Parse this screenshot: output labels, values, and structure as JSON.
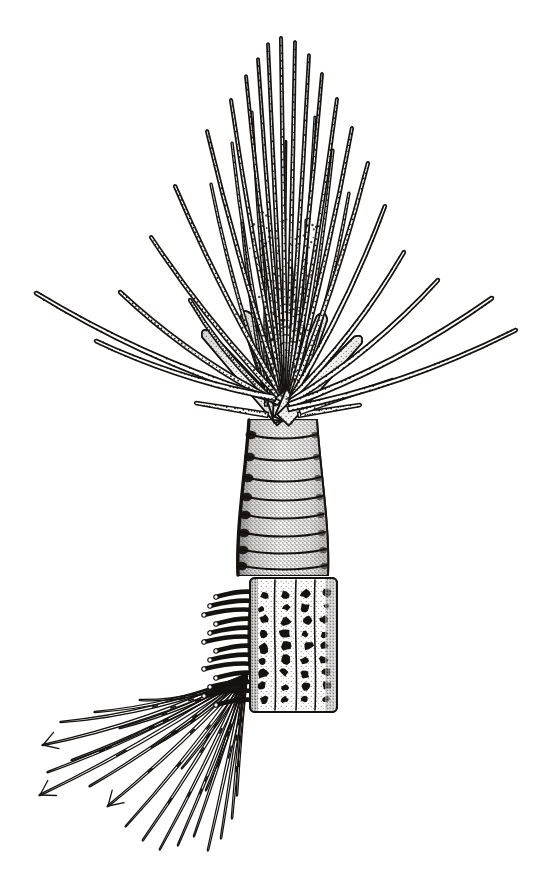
{
  "figure": {
    "domain": "Natural-Image",
    "kind": "scientific-line-drawing",
    "technique": "pen-and-ink stipple",
    "caption": "",
    "background_color": "#ffffff",
    "ink_color": "#15120f",
    "canvas": {
      "width": 549,
      "height": 875
    }
  },
  "anatomy": {
    "parts": [
      {
        "id": "tentacle-crown",
        "label": "Buccal tentacle crown",
        "note": "dense spray of long slender grooved tentacles radiating upward and outward"
      },
      {
        "id": "crown-base-lobes",
        "label": "Crown basal lobes",
        "note": "broad overlapping stippled lobes at the tentacle origin"
      },
      {
        "id": "thorax-segments",
        "label": "Ringed thoracic segments",
        "note": "cylindrical stalk with ~8 annular rings, heavy stipple shading"
      },
      {
        "id": "abdominal-plate",
        "label": "Papillated abdominal plate",
        "note": "rectangular plate bearing columns of dark rounded papillae"
      },
      {
        "id": "uncinal-comb",
        "label": "Uncinal comb / neuropodial hooks",
        "note": "comb-like row of short thick hooks on the left margin of the plate"
      },
      {
        "id": "capillary-chaetae",
        "label": "Capillary chaetae",
        "note": "long tapering bristles fanning down and to the left, several bifurcate at the tip"
      }
    ],
    "counts": {
      "crown_tentacles": 34,
      "thoracic_rings": 8,
      "papilla_columns": 4,
      "uncinal_hooks": 13,
      "capillary_chaetae": 22,
      "forked_chaetae_tips": 3
    }
  },
  "geometry": {
    "stalk_axis_x": 283,
    "crown_apex_y": 38,
    "crown_base_y": 418,
    "thorax_top_y": 420,
    "thorax_bottom_y": 575,
    "plate_top_y": 578,
    "plate_bottom_y": 712,
    "plate_left_x": 250,
    "plate_right_x": 337,
    "chaetae_origin_x": 246,
    "chaetae_origin_y": 676,
    "bounds": {
      "left": 33,
      "right": 520,
      "top": 38,
      "bottom": 850
    }
  },
  "crown_tentacles": [
    {
      "ox": 277,
      "oy": 404,
      "tipx": 190,
      "tipy": 300,
      "w": 4.6,
      "bend": -26,
      "stipple": "dotted-midline"
    },
    {
      "ox": 279,
      "oy": 403,
      "tipx": 120,
      "tipy": 292,
      "w": 5.0,
      "bend": -34,
      "stipple": "dotted-midline"
    },
    {
      "ox": 275,
      "oy": 400,
      "tipx": 36,
      "tipy": 293,
      "w": 5.4,
      "bend": -40,
      "stipple": "dotted-edge"
    },
    {
      "ox": 276,
      "oy": 398,
      "tipx": 96,
      "tipy": 341,
      "w": 5.2,
      "bend": -30,
      "stipple": "dotted-edge"
    },
    {
      "ox": 278,
      "oy": 396,
      "tipx": 151,
      "tipy": 237,
      "w": 4.4,
      "bend": -22,
      "stipple": "dotted-midline"
    },
    {
      "ox": 280,
      "oy": 394,
      "tipx": 175,
      "tipy": 186,
      "w": 4.2,
      "bend": -18,
      "stipple": "dotted-midline"
    },
    {
      "ox": 281,
      "oy": 392,
      "tipx": 207,
      "tipy": 131,
      "w": 4.0,
      "bend": -14,
      "stipple": "dotted-midline"
    },
    {
      "ox": 282,
      "oy": 390,
      "tipx": 231,
      "tipy": 100,
      "w": 3.8,
      "bend": -10,
      "stipple": "dotted-midline"
    },
    {
      "ox": 283,
      "oy": 389,
      "tipx": 246,
      "tipy": 76,
      "w": 3.6,
      "bend": -7,
      "stipple": "dotted-midline"
    },
    {
      "ox": 284,
      "oy": 388,
      "tipx": 258,
      "tipy": 59,
      "w": 3.5,
      "bend": -5,
      "stipple": "dotted-midline"
    },
    {
      "ox": 285,
      "oy": 388,
      "tipx": 268,
      "tipy": 44,
      "w": 3.6,
      "bend": -3,
      "stipple": "dotted-midline"
    },
    {
      "ox": 286,
      "oy": 388,
      "tipx": 281,
      "tipy": 38,
      "w": 3.8,
      "bend": 0,
      "stipple": "dotted-midline"
    },
    {
      "ox": 287,
      "oy": 388,
      "tipx": 295,
      "tipy": 42,
      "w": 3.7,
      "bend": 3,
      "stipple": "dotted-midline"
    },
    {
      "ox": 288,
      "oy": 389,
      "tipx": 309,
      "tipy": 55,
      "w": 3.6,
      "bend": 5,
      "stipple": "dotted-midline"
    },
    {
      "ox": 289,
      "oy": 390,
      "tipx": 322,
      "tipy": 74,
      "w": 3.7,
      "bend": 8,
      "stipple": "dotted-midline"
    },
    {
      "ox": 290,
      "oy": 391,
      "tipx": 337,
      "tipy": 99,
      "w": 3.9,
      "bend": 11,
      "stipple": "dotted-midline"
    },
    {
      "ox": 291,
      "oy": 393,
      "tipx": 352,
      "tipy": 128,
      "w": 4.1,
      "bend": 15,
      "stipple": "dotted-midline"
    },
    {
      "ox": 292,
      "oy": 395,
      "tipx": 368,
      "tipy": 163,
      "w": 4.3,
      "bend": 19,
      "stipple": "dotted-midline"
    },
    {
      "ox": 292,
      "oy": 397,
      "tipx": 385,
      "tipy": 206,
      "w": 4.6,
      "bend": 24,
      "stipple": "dotted-edge"
    },
    {
      "ox": 291,
      "oy": 399,
      "tipx": 404,
      "tipy": 252,
      "w": 4.9,
      "bend": 29,
      "stipple": "dotted-edge"
    },
    {
      "ox": 290,
      "oy": 402,
      "tipx": 438,
      "tipy": 280,
      "w": 5.2,
      "bend": 33,
      "stipple": "dotted-edge"
    },
    {
      "ox": 289,
      "oy": 405,
      "tipx": 492,
      "tipy": 298,
      "w": 5.4,
      "bend": 37,
      "stipple": "dotted-edge"
    },
    {
      "ox": 288,
      "oy": 409,
      "tipx": 516,
      "tipy": 330,
      "w": 5.0,
      "bend": 40,
      "stipple": "dotted-edge"
    },
    {
      "ox": 271,
      "oy": 400,
      "tipx": 211,
      "tipy": 184,
      "w": 3.4,
      "bend": -20,
      "stipple": "inner"
    },
    {
      "ox": 273,
      "oy": 399,
      "tipx": 232,
      "tipy": 143,
      "w": 3.2,
      "bend": -14,
      "stipple": "inner"
    },
    {
      "ox": 275,
      "oy": 398,
      "tipx": 252,
      "tipy": 112,
      "w": 3.0,
      "bend": -9,
      "stipple": "inner"
    },
    {
      "ox": 293,
      "oy": 398,
      "tipx": 315,
      "tipy": 117,
      "w": 3.0,
      "bend": 9,
      "stipple": "inner"
    },
    {
      "ox": 295,
      "oy": 399,
      "tipx": 333,
      "tipy": 150,
      "w": 3.2,
      "bend": 14,
      "stipple": "inner"
    },
    {
      "ox": 297,
      "oy": 401,
      "tipx": 349,
      "tipy": 193,
      "w": 3.4,
      "bend": 19,
      "stipple": "inner"
    },
    {
      "ox": 268,
      "oy": 402,
      "tipx": 242,
      "tipy": 223,
      "w": 2.8,
      "bend": -12,
      "stipple": "inner"
    },
    {
      "ox": 299,
      "oy": 403,
      "tipx": 306,
      "tipy": 220,
      "w": 2.8,
      "bend": 7,
      "stipple": "inner"
    },
    {
      "ox": 266,
      "oy": 406,
      "tipx": 266,
      "tipy": 252,
      "w": 2.6,
      "bend": -5,
      "stipple": "inner"
    },
    {
      "ox": 301,
      "oy": 406,
      "tipx": 290,
      "tipy": 248,
      "w": 2.6,
      "bend": 4,
      "stipple": "inner"
    },
    {
      "ox": 283,
      "oy": 392,
      "tipx": 286,
      "tipy": 141,
      "w": 2.4,
      "bend": 1,
      "stipple": "inner"
    }
  ],
  "crown_lobes": [
    {
      "ox": 283,
      "oy": 420,
      "tipx": 206,
      "tipy": 334,
      "w": 16
    },
    {
      "ox": 283,
      "oy": 420,
      "tipx": 246,
      "tipy": 316,
      "w": 18
    },
    {
      "ox": 283,
      "oy": 420,
      "tipx": 283,
      "tipy": 306,
      "w": 20
    },
    {
      "ox": 283,
      "oy": 420,
      "tipx": 322,
      "tipy": 318,
      "w": 18
    },
    {
      "ox": 283,
      "oy": 420,
      "tipx": 358,
      "tipy": 340,
      "w": 16
    }
  ],
  "basal_cirri": [
    {
      "ox": 268,
      "oy": 415,
      "tipx": 196,
      "tipy": 403,
      "w": 5
    },
    {
      "ox": 298,
      "oy": 415,
      "tipx": 360,
      "tipy": 405,
      "w": 5
    },
    {
      "ox": 300,
      "oy": 412,
      "tipx": 393,
      "tipy": 380,
      "w": 5
    }
  ],
  "thoracic_rings": [
    {
      "cy": 434,
      "h": 20
    },
    {
      "cy": 456,
      "h": 20
    },
    {
      "cy": 477,
      "h": 19
    },
    {
      "cy": 496,
      "h": 18
    },
    {
      "cy": 514,
      "h": 18
    },
    {
      "cy": 532,
      "h": 17
    },
    {
      "cy": 549,
      "h": 16
    },
    {
      "cy": 565,
      "h": 15
    }
  ],
  "papilla_columns": [
    {
      "x": 263,
      "count": 9
    },
    {
      "x": 285,
      "count": 9
    },
    {
      "x": 306,
      "count": 9
    },
    {
      "x": 325,
      "count": 9
    }
  ],
  "capillary_chaetae": [
    {
      "tipx": 61,
      "tipy": 722,
      "w": 3.4,
      "curve": -30,
      "forked": false
    },
    {
      "tipx": 43,
      "tipy": 745,
      "w": 3.4,
      "curve": -26,
      "forked": true
    },
    {
      "tipx": 48,
      "tipy": 772,
      "w": 3.3,
      "curve": -22,
      "forked": false
    },
    {
      "tipx": 40,
      "tipy": 795,
      "w": 3.3,
      "curve": -18,
      "forked": true
    },
    {
      "tipx": 72,
      "tipy": 760,
      "w": 3.2,
      "curve": -20,
      "forked": false
    },
    {
      "tipx": 90,
      "tipy": 786,
      "w": 3.2,
      "curve": -16,
      "forked": false
    },
    {
      "tipx": 108,
      "tipy": 806,
      "w": 3.1,
      "curve": -14,
      "forked": true
    },
    {
      "tipx": 126,
      "tipy": 826,
      "w": 3.1,
      "curve": -12,
      "forked": false
    },
    {
      "tipx": 143,
      "tipy": 840,
      "w": 3.0,
      "curve": -10,
      "forked": false
    },
    {
      "tipx": 160,
      "tipy": 849,
      "w": 3.0,
      "curve": -8,
      "forked": false
    },
    {
      "tipx": 178,
      "tipy": 845,
      "w": 3.0,
      "curve": -6,
      "forked": false
    },
    {
      "tipx": 194,
      "tipy": 836,
      "w": 3.0,
      "curve": -4,
      "forked": false
    },
    {
      "tipx": 208,
      "tipy": 850,
      "w": 3.2,
      "curve": -2,
      "forked": false
    },
    {
      "tipx": 221,
      "tipy": 838,
      "w": 3.2,
      "curve": 0,
      "forked": false
    },
    {
      "tipx": 232,
      "tipy": 818,
      "w": 3.0,
      "curve": 2,
      "forked": false
    },
    {
      "tipx": 237,
      "tipy": 795,
      "w": 2.9,
      "curve": 3,
      "forked": false
    },
    {
      "tipx": 120,
      "tipy": 728,
      "w": 3.0,
      "curve": -18,
      "forked": false
    },
    {
      "tipx": 152,
      "tipy": 747,
      "w": 3.0,
      "curve": -15,
      "forked": false
    },
    {
      "tipx": 182,
      "tipy": 768,
      "w": 2.9,
      "curve": -12,
      "forked": false
    },
    {
      "tipx": 206,
      "tipy": 790,
      "w": 2.9,
      "curve": -9,
      "forked": false
    },
    {
      "tipx": 95,
      "tipy": 712,
      "w": 3.0,
      "curve": -24,
      "forked": false
    },
    {
      "tipx": 140,
      "tipy": 700,
      "w": 2.8,
      "curve": -28,
      "forked": false
    }
  ],
  "uncinal_hooks": [
    {
      "y": 592
    },
    {
      "y": 601
    },
    {
      "y": 610
    },
    {
      "y": 619
    },
    {
      "y": 628
    },
    {
      "y": 637
    },
    {
      "y": 646
    },
    {
      "y": 655
    },
    {
      "y": 664
    },
    {
      "y": 673
    },
    {
      "y": 682
    },
    {
      "y": 691
    },
    {
      "y": 700
    }
  ]
}
